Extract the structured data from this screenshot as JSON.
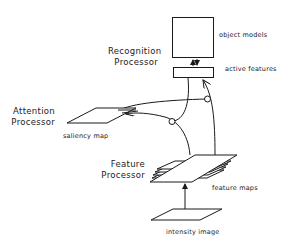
{
  "diagram": {
    "processors": {
      "recognition": {
        "line1": "Recognition",
        "line2": "Processor"
      },
      "attention": {
        "line1": "Attention",
        "line2": "Processor"
      },
      "feature": {
        "line1": "Feature",
        "line2": "Processor"
      }
    },
    "components": {
      "object_models": "object models",
      "active_features": "active features",
      "saliency_map": "saliency map",
      "feature_maps": "feature maps",
      "intensity_image": "intensity image"
    },
    "colors": {
      "stroke": "#1a1a1a",
      "background": "#ffffff",
      "text": "#222222"
    },
    "connections": [
      {
        "from": "intensity image",
        "to": "feature maps",
        "type": "arrow"
      },
      {
        "from": "feature maps",
        "to": "active features",
        "type": "arrow"
      },
      {
        "from": "feature maps",
        "to": "saliency map",
        "type": "arrow"
      },
      {
        "from": "active features",
        "to": "saliency map",
        "type": "arrow-gated"
      },
      {
        "from": "active features",
        "to": "object models",
        "type": "bidirectional"
      }
    ]
  }
}
